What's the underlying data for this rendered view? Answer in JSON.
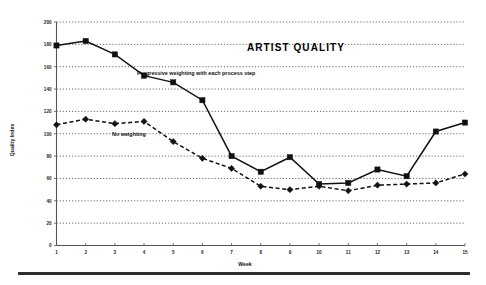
{
  "figure": {
    "title": "ARTIST QUALITY",
    "bottom_rule": "horizontal-rule"
  },
  "chart_data": {
    "type": "line",
    "title": "ARTIST QUALITY",
    "xlabel": "Week",
    "ylabel": "Quality Index",
    "x": [
      1,
      2,
      3,
      4,
      5,
      6,
      7,
      8,
      9,
      10,
      11,
      12,
      13,
      14,
      15
    ],
    "xtick_labels": [
      "1",
      "2",
      "3",
      "4",
      "5",
      "6",
      "7",
      "8",
      "9",
      "10",
      "11",
      "12",
      "13",
      "14",
      "15"
    ],
    "ytick_labels": [
      "0",
      "20",
      "40",
      "60",
      "80",
      "100",
      "120",
      "140",
      "160",
      "180",
      "200"
    ],
    "ylim": [
      0,
      200
    ],
    "xlim": [
      1,
      15
    ],
    "ytick_step": 20,
    "grid": true,
    "legend_position": "inline-annotations",
    "series": [
      {
        "name": "Progressive weighting with each process step",
        "marker": "square",
        "linestyle": "solid",
        "color": "#111111",
        "values": [
          179,
          183,
          171,
          152,
          146,
          130,
          80,
          66,
          79,
          55,
          56,
          68,
          62,
          102,
          110
        ]
      },
      {
        "name": "No weighting",
        "marker": "diamond",
        "linestyle": "dashed",
        "color": "#111111",
        "values": [
          108,
          113,
          109,
          111,
          93,
          78,
          69,
          53,
          50,
          53,
          49,
          54,
          55,
          56,
          64
        ]
      }
    ],
    "annotations": [
      {
        "text": "Progressive weighting with each process step",
        "x": 4.0,
        "y": 152
      },
      {
        "text": "No weighting",
        "x": 3.1,
        "y": 98
      }
    ]
  }
}
